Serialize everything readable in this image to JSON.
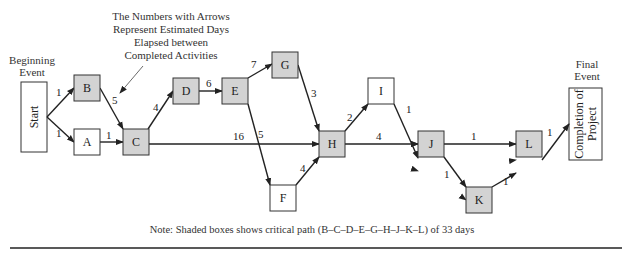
{
  "annotation": {
    "lines": [
      "The Numbers with Arrows",
      "Represent Estimated Days",
      "Elapsed between",
      "Completed Activities"
    ]
  },
  "beginning_event": {
    "label_lines": [
      "Beginning",
      "Event"
    ],
    "box_text": "Start"
  },
  "final_event": {
    "label_lines": [
      "Final",
      "Event"
    ],
    "box_lines": [
      "Completion of",
      "Project"
    ]
  },
  "colors": {
    "shaded": "#d3d3d3",
    "unshaded": "#ffffff",
    "stroke": "#333333"
  },
  "nodes": [
    {
      "id": "B",
      "label": "B",
      "critical": true,
      "x": 74,
      "y": 75,
      "w": 26,
      "h": 26
    },
    {
      "id": "A",
      "label": "A",
      "critical": false,
      "x": 74,
      "y": 129,
      "w": 26,
      "h": 26
    },
    {
      "id": "C",
      "label": "C",
      "critical": true,
      "x": 123,
      "y": 129,
      "w": 26,
      "h": 26
    },
    {
      "id": "D",
      "label": "D",
      "critical": true,
      "x": 173,
      "y": 78,
      "w": 26,
      "h": 26
    },
    {
      "id": "E",
      "label": "E",
      "critical": true,
      "x": 222,
      "y": 78,
      "w": 26,
      "h": 26
    },
    {
      "id": "G",
      "label": "G",
      "critical": true,
      "x": 272,
      "y": 52,
      "w": 26,
      "h": 26
    },
    {
      "id": "F",
      "label": "F",
      "critical": false,
      "x": 270,
      "y": 185,
      "w": 26,
      "h": 26
    },
    {
      "id": "H",
      "label": "H",
      "critical": true,
      "x": 319,
      "y": 131,
      "w": 26,
      "h": 26
    },
    {
      "id": "I",
      "label": "I",
      "critical": false,
      "x": 368,
      "y": 78,
      "w": 26,
      "h": 26
    },
    {
      "id": "J",
      "label": "J",
      "critical": true,
      "x": 418,
      "y": 158,
      "w": 26,
      "h": 26
    },
    {
      "id": "K",
      "label": "K",
      "critical": true,
      "x": 466,
      "y": 187,
      "w": 26,
      "h": 26
    },
    {
      "id": "L",
      "label": "L",
      "critical": true,
      "x": 516,
      "y": 147,
      "w": 26,
      "h": 26
    }
  ],
  "edges": [
    {
      "from": "Start",
      "to": "B",
      "days": "1"
    },
    {
      "from": "Start",
      "to": "A",
      "days": "1"
    },
    {
      "from": "B",
      "to": "C",
      "days": "5"
    },
    {
      "from": "A",
      "to": "C",
      "days": "1"
    },
    {
      "from": "C",
      "to": "D",
      "days": "4"
    },
    {
      "from": "D",
      "to": "E",
      "days": "6"
    },
    {
      "from": "E",
      "to": "G",
      "days": "7"
    },
    {
      "from": "E",
      "to": "F",
      "days": "5"
    },
    {
      "from": "C",
      "to": "H",
      "days": "16"
    },
    {
      "from": "G",
      "to": "H",
      "days": "3"
    },
    {
      "from": "F",
      "to": "H",
      "days": "4"
    },
    {
      "from": "H",
      "to": "I",
      "days": "2"
    },
    {
      "from": "H",
      "to": "J",
      "days": "4"
    },
    {
      "from": "I",
      "to": "J",
      "days": "1"
    },
    {
      "from": "J",
      "to": "L",
      "days": "1"
    },
    {
      "from": "J",
      "to": "K",
      "days": "1"
    },
    {
      "from": "K",
      "to": "L",
      "days": "1"
    },
    {
      "from": "L",
      "to": "Completion",
      "days": "1"
    }
  ],
  "note": "Note: Shaded boxes shows critical path (B–C–D–E–G–H–J–K–L) of 33 days"
}
